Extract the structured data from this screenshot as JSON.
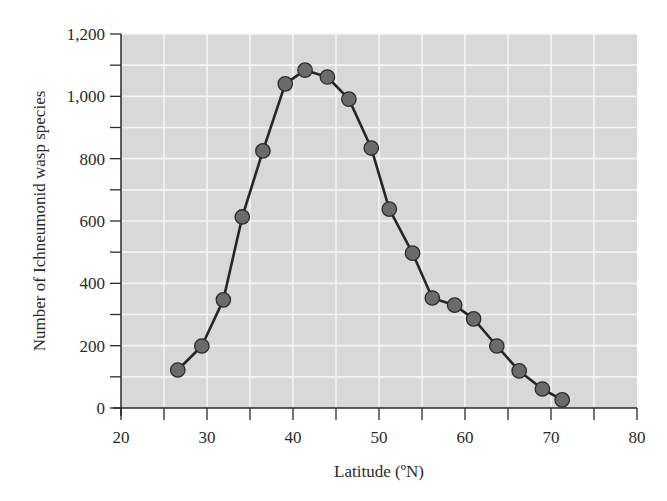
{
  "chart_data": {
    "type": "line",
    "title": "",
    "xlabel": "Latitude (ºN)",
    "ylabel": "Number of Ichneumonid wasp species",
    "xlim": [
      20,
      80
    ],
    "ylim": [
      0,
      1200
    ],
    "x_ticks": [
      20,
      30,
      40,
      50,
      60,
      70,
      80
    ],
    "x_tick_labels": [
      "20",
      "30",
      "40",
      "50",
      "60",
      "70",
      "80"
    ],
    "x_minor_step": 5,
    "y_ticks": [
      0,
      200,
      400,
      600,
      800,
      1000,
      1200
    ],
    "y_tick_labels": [
      "0",
      "200",
      "400",
      "600",
      "800",
      "1,000",
      "1,200"
    ],
    "y_minor_step": 100,
    "grid": true,
    "legend": null,
    "series": [
      {
        "name": "Ichneumonid wasp species",
        "marker": "circle",
        "x": [
          26.6,
          29.4,
          31.9,
          34.1,
          36.5,
          39.1,
          41.4,
          44.0,
          46.5,
          49.1,
          51.2,
          53.9,
          56.2,
          58.8,
          61.0,
          63.7,
          66.3,
          69.0,
          71.3
        ],
        "y": [
          122,
          199,
          347,
          613,
          825,
          1040,
          1084,
          1062,
          991,
          834,
          638,
          497,
          353,
          330,
          286,
          199,
          119,
          61,
          26
        ]
      }
    ],
    "colors": {
      "plot_background": "#d8d8d8",
      "grid": "#f4f4f4",
      "line": "#262626",
      "marker_fill": "#6b6b6b",
      "marker_stroke": "#2b2b2b",
      "axis": "#2a2a2a"
    }
  }
}
